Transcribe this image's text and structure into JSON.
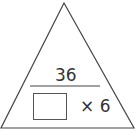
{
  "diagram": {
    "type": "multiplication-division triangle",
    "top_value": "36",
    "missing_box": "",
    "operator": "×",
    "known_factor": "6",
    "bottom_right_text": "× 6"
  }
}
